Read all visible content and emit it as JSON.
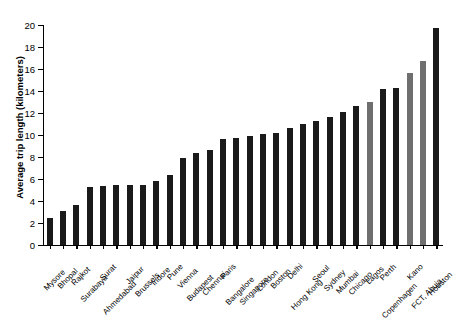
{
  "chart_data": {
    "type": "bar",
    "title": "",
    "xlabel": "",
    "ylabel": "Average trip length (kilometers)",
    "ylim": [
      0,
      20
    ],
    "ytick_labels": [
      "0",
      "2",
      "4",
      "6",
      "8",
      "10",
      "12",
      "14",
      "16",
      "18",
      "20"
    ],
    "ytick_values": [
      0,
      2,
      4,
      6,
      8,
      10,
      12,
      14,
      16,
      18,
      20
    ],
    "grid": false,
    "legend": "none",
    "categories": [
      "Mysore",
      "Bhopal",
      "Rajkot",
      "Surabaya",
      "Surat",
      "Ahmedabad",
      "Jaipur",
      "Brussels",
      "Indore",
      "Pune",
      "Vienna",
      "Budapest",
      "Chennai",
      "Paris",
      "Bangalore",
      "Singapore",
      "London",
      "Boston",
      "Delhi",
      "Hong Kong",
      "Seoul",
      "Sydney",
      "Mumbai",
      "Chicago",
      "Lagos",
      "Perth",
      "Copenhagen",
      "Kano",
      "FCT, Abuja",
      "Houston"
    ],
    "values": [
      2.5,
      3.1,
      3.6,
      5.3,
      5.4,
      5.5,
      5.5,
      5.5,
      5.8,
      6.4,
      7.9,
      8.4,
      8.6,
      9.6,
      9.7,
      9.9,
      10.1,
      10.2,
      10.6,
      11.0,
      11.3,
      11.6,
      12.1,
      12.6,
      13.0,
      14.2,
      14.3,
      15.6,
      16.7,
      19.7
    ],
    "bar_colors": [
      "#1a1a1a",
      "#1a1a1a",
      "#1a1a1a",
      "#1a1a1a",
      "#1a1a1a",
      "#1a1a1a",
      "#1a1a1a",
      "#1a1a1a",
      "#1a1a1a",
      "#1a1a1a",
      "#1a1a1a",
      "#1a1a1a",
      "#1a1a1a",
      "#1a1a1a",
      "#1a1a1a",
      "#1a1a1a",
      "#1a1a1a",
      "#1a1a1a",
      "#1a1a1a",
      "#1a1a1a",
      "#1a1a1a",
      "#1a1a1a",
      "#1a1a1a",
      "#1a1a1a",
      "#6f6f6f",
      "#1a1a1a",
      "#1a1a1a",
      "#6f6f6f",
      "#6f6f6f",
      "#1a1a1a"
    ],
    "colors": {
      "default_bar": "#1a1a1a",
      "highlight_bar": "#6f6f6f",
      "axis": "#000000",
      "background": "#ffffff"
    }
  }
}
